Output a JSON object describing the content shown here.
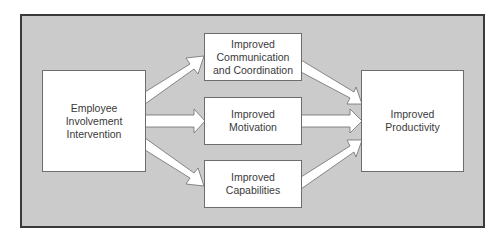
{
  "diagram": {
    "type": "flow",
    "background_color": "#cbcbcb",
    "border_color": "#3a3a3a",
    "nodes": {
      "source": {
        "lines": [
          "Employee",
          "Involvement",
          "Intervention"
        ]
      },
      "communication": {
        "lines": [
          "Improved",
          "Communication",
          "and Coordination"
        ]
      },
      "motivation": {
        "lines": [
          "Improved",
          "Motivation"
        ]
      },
      "capabilities": {
        "lines": [
          "Improved",
          "Capabilities"
        ]
      },
      "target": {
        "lines": [
          "Improved",
          "Productivity"
        ]
      }
    },
    "edges": [
      {
        "from": "source",
        "to": "communication"
      },
      {
        "from": "source",
        "to": "motivation"
      },
      {
        "from": "source",
        "to": "capabilities"
      },
      {
        "from": "communication",
        "to": "target"
      },
      {
        "from": "motivation",
        "to": "target"
      },
      {
        "from": "capabilities",
        "to": "target"
      }
    ]
  }
}
